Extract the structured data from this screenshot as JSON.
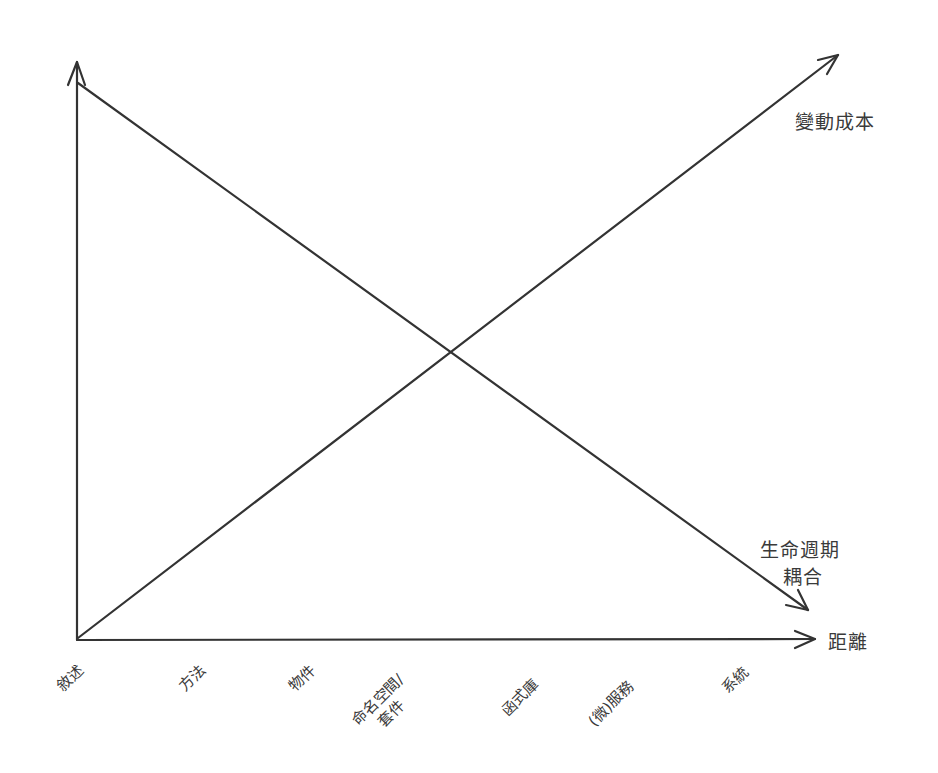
{
  "diagram": {
    "x_axis": {
      "label": "距離"
    },
    "series": [
      {
        "name": "變動成本",
        "trend": "rising"
      },
      {
        "name": "生命週期耦合",
        "line1": "生命週期",
        "line2": "耦合",
        "trend": "falling"
      }
    ],
    "ticks": [
      "敘述",
      "方法",
      "物件",
      "命名空間/套件",
      "函式庫",
      "(微)服務",
      "系統"
    ],
    "tick_namespace": {
      "line1": "命名空間/",
      "line2": "套件"
    },
    "stroke_color": "#333333"
  }
}
